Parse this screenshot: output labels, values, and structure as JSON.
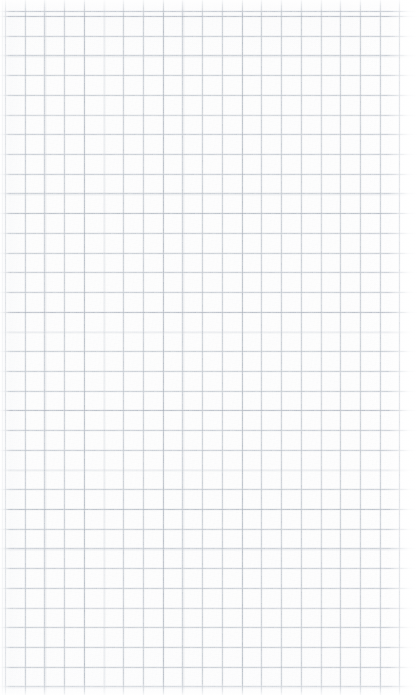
{
  "document": {
    "kind": "scanned-grid-paper",
    "title": "Blank grid paper page",
    "caption": "Blank squared graph paper, no handwriting or printed text",
    "width_px": 417,
    "height_px": 695,
    "orientation": "portrait"
  },
  "paper": {
    "background_color": "#fdfdfd",
    "edge_highlight_color": "#ffffff",
    "texture": "scanner noise / paper fibre",
    "has_text": "no",
    "has_margin_rule": "no",
    "has_holes": "no"
  },
  "grid": {
    "style": "square",
    "line_color": "#a8b0ba",
    "bleed_color": "#bac1ca",
    "accent_line_color": "#969eaa",
    "cell_size_px": 19.72,
    "line_width_px": 0.9,
    "first_vertical_line_x_px": 5,
    "first_horizontal_line_y_px": 16,
    "vertical_line_count": 21,
    "horizontal_line_count": 35,
    "fade_region": "right edge"
  }
}
